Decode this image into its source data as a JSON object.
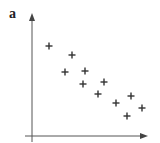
{
  "panel_label": "a",
  "chart_data": {
    "type": "scatter",
    "title": "",
    "xlabel": "",
    "ylabel": "",
    "grid": false,
    "legend": null,
    "marker": "plus",
    "axis_ticks": "none",
    "trend": "negative correlation",
    "points": [
      {
        "x": 49,
        "y": 46
      },
      {
        "x": 72,
        "y": 55
      },
      {
        "x": 65,
        "y": 72
      },
      {
        "x": 85,
        "y": 71
      },
      {
        "x": 83,
        "y": 84
      },
      {
        "x": 104,
        "y": 82
      },
      {
        "x": 98,
        "y": 94
      },
      {
        "x": 116,
        "y": 103
      },
      {
        "x": 131,
        "y": 96
      },
      {
        "x": 142,
        "y": 108
      },
      {
        "x": 127,
        "y": 116
      }
    ],
    "axes": {
      "y_axis": {
        "x": 32,
        "top": 13,
        "bottom": 142
      },
      "x_axis": {
        "y": 136,
        "left": 25,
        "right": 148
      }
    }
  },
  "colors": {
    "ink": "#333333",
    "background": "#ffffff"
  }
}
